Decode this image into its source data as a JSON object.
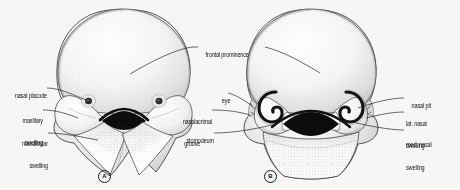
{
  "figure": {
    "background_color": "#f6f6f5",
    "ink_color": "#1a1a1a",
    "width": 460,
    "height": 190
  },
  "panels": [
    {
      "id": "A",
      "id_display": "A",
      "caption": "A",
      "labels": [
        {
          "key": "nasal_placode",
          "text": "nasal placode",
          "side": "left"
        },
        {
          "key": "maxillary_swelling",
          "text": "maxillary\nswelling",
          "side": "left"
        },
        {
          "key": "mandibular_swelling",
          "text": "mandibular\nswelling",
          "side": "left"
        },
        {
          "key": "frontal_prominence",
          "text": "frontal prominence",
          "side": "right"
        }
      ]
    },
    {
      "id": "B",
      "id_display": "B",
      "caption": "B",
      "labels": [
        {
          "key": "eye",
          "text": "eye",
          "side": "left"
        },
        {
          "key": "nasolacrimal_groove",
          "text": "nasolacrimal\ngroove",
          "side": "left"
        },
        {
          "key": "stomodeum",
          "text": "stomodeum",
          "side": "left"
        },
        {
          "key": "nasal_pit",
          "text": "nasal pit",
          "side": "right"
        },
        {
          "key": "lat_nasal_swelling",
          "text": "lat. nasal\nswelling",
          "side": "right"
        },
        {
          "key": "med_nasal_swelling",
          "text": "med. nasal\nswelling",
          "side": "right"
        }
      ]
    }
  ],
  "labels": {
    "nasal_placode": "nasal placode",
    "maxillary_swelling_l1": "maxillary",
    "maxillary_swelling_l2": "swelling",
    "mandibular_swelling_l1": "mandibular",
    "mandibular_swelling_l2": "swelling",
    "frontal_prominence": "frontal prominence",
    "eye": "eye",
    "nasolacrimal_groove_l1": "nasolacrimal",
    "nasolacrimal_groove_l2": "groove",
    "stomodeum": "stomodeum",
    "nasal_pit": "nasal pit",
    "lat_nasal_swelling_l1": "lat. nasal",
    "lat_nasal_swelling_l2": "swelling",
    "med_nasal_swelling_l1": "med. nasal",
    "med_nasal_swelling_l2": "swelling",
    "panel_a": "A",
    "panel_b": "B"
  }
}
